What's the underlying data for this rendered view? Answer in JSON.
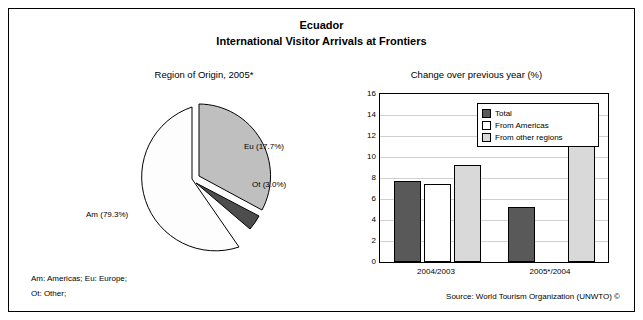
{
  "header": {
    "title": "Ecuador",
    "subtitle": "International Visitor Arrivals at Frontiers"
  },
  "pie_head": "Region of Origin, 2005*",
  "bar_head": "Change over previous year (%)",
  "footnotes": {
    "line1": "Am: Americas; Eu: Europe;",
    "line2": "Ot: Other;"
  },
  "source": "Source: World Tourism Organization (UNWTO) ©",
  "colors": {
    "total": "#595959",
    "americas": "#ffffff",
    "other": "#d9d9d9",
    "pie_am": "#fdfdfd",
    "pie_eu": "#bfbfbf",
    "pie_ot": "#4d4d4d"
  },
  "chart_data": [
    {
      "type": "pie",
      "title": "Region of Origin, 2005*",
      "labels": [
        "Am (79.3%)",
        "Eu (17.7%)",
        "Ot (3.0%)"
      ],
      "slices": [
        {
          "name": "Am",
          "label": "Am (79.3%)",
          "value": 79.3
        },
        {
          "name": "Eu",
          "label": "Eu (17.7%)",
          "value": 17.7
        },
        {
          "name": "Ot",
          "label": "Ot (3.0%)",
          "value": 3.0
        }
      ]
    },
    {
      "type": "bar",
      "title": "Change over previous year (%)",
      "categories": [
        "2004/2003",
        "2005*/2004"
      ],
      "ylim": [
        0,
        16
      ],
      "yticks": [
        0,
        2,
        4,
        6,
        8,
        10,
        12,
        14,
        16
      ],
      "ylabel": "",
      "xlabel": "",
      "grid": true,
      "legend_position": "top-right",
      "series": [
        {
          "name": "Total",
          "values": [
            7.7,
            5.2
          ]
        },
        {
          "name": "From Americas",
          "values": [
            7.4,
            0.0
          ]
        },
        {
          "name": "From other regions",
          "values": [
            9.2,
            13.4
          ]
        }
      ]
    }
  ]
}
